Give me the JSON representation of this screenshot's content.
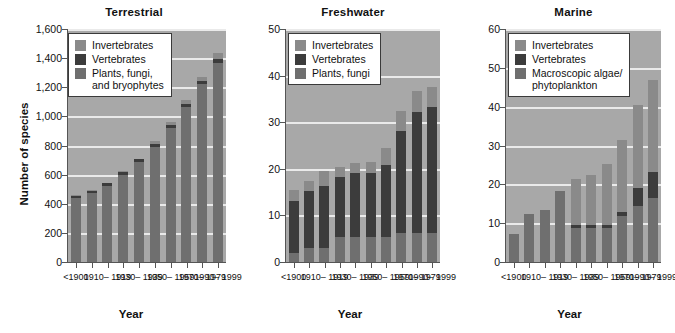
{
  "figure": {
    "axis_title_y": "Number of species",
    "axis_title_x": "Year"
  },
  "categories": [
    "<1900",
    "1900–1909",
    "1910–1919",
    "1920–1929",
    "1930–1939",
    "1940–1949",
    "1950–1959",
    "1960–1969",
    "1970–1979",
    "1980–1989"
  ],
  "tick_labels": [
    "<1900",
    "",
    "1910–\n1919",
    "",
    "1930–\n1939",
    "",
    "1950–\n1959",
    "",
    "1970–\n1979",
    "1990–\n1999"
  ],
  "colors": {
    "invertebrates": "#8a8a8a",
    "vertebrates": "#3c3c3c",
    "plants": "#6f6f6f",
    "plot_background": "#a8a8a8",
    "gridline": "#eaeaea",
    "axis": "#555555"
  },
  "panels": [
    {
      "id": "terrestrial",
      "title": "Terrestrial",
      "legend": [
        {
          "label": "Invertebrates",
          "color": "#8a8a8a"
        },
        {
          "label": "Vertebrates",
          "color": "#3c3c3c"
        },
        {
          "label": "Plants, fungi,\nand bryophytes",
          "color": "#6f6f6f"
        }
      ],
      "ylim": [
        0,
        1600
      ],
      "yticks": [
        0,
        200,
        400,
        600,
        800,
        1000,
        1200,
        1400,
        1600
      ],
      "ytick_labels": [
        "0",
        "200",
        "400",
        "600",
        "800",
        "1,000",
        "1,200",
        "1,400",
        "1,600"
      ]
    },
    {
      "id": "freshwater",
      "title": "Freshwater",
      "legend": [
        {
          "label": "Invertebrates",
          "color": "#8a8a8a"
        },
        {
          "label": "Vertebrates",
          "color": "#3c3c3c"
        },
        {
          "label": "Plants, fungi",
          "color": "#6f6f6f"
        }
      ],
      "ylim": [
        0,
        50
      ],
      "yticks": [
        0,
        10,
        20,
        30,
        40,
        50
      ],
      "ytick_labels": [
        "0",
        "10",
        "20",
        "30",
        "40",
        "50"
      ]
    },
    {
      "id": "marine",
      "title": "Marine",
      "legend": [
        {
          "label": "Invertebrates",
          "color": "#8a8a8a"
        },
        {
          "label": "Vertebrates",
          "color": "#3c3c3c"
        },
        {
          "label": "Macroscopic algae/\nphytoplankton",
          "color": "#6f6f6f"
        }
      ],
      "ylim": [
        0,
        60
      ],
      "yticks": [
        0,
        10,
        20,
        30,
        40,
        50,
        60
      ],
      "ytick_labels": [
        "0",
        "10",
        "20",
        "30",
        "40",
        "50",
        "60"
      ]
    }
  ],
  "chart_data": [
    {
      "type": "bar",
      "title": "Terrestrial",
      "stacked": true,
      "xlabel": "Year",
      "ylabel": "Number of species",
      "ylim": [
        0,
        1600
      ],
      "yticks": [
        0,
        200,
        400,
        600,
        800,
        1000,
        1200,
        1400,
        1600
      ],
      "grid": true,
      "legend_position": "top-left",
      "categories": [
        "<1900",
        "1900–1909",
        "1910–1919",
        "1920–1929",
        "1930–1939",
        "1940–1949",
        "1950–1959",
        "1960–1969",
        "1970–1979",
        "1990–1999"
      ],
      "series": [
        {
          "name": "Plants, fungi, and bryophytes",
          "color": "#6f6f6f",
          "values": [
            440,
            475,
            520,
            600,
            685,
            790,
            920,
            1065,
            1220,
            1370
          ]
        },
        {
          "name": "Vertebrates",
          "color": "#3c3c3c",
          "values": [
            15,
            15,
            20,
            20,
            20,
            20,
            20,
            20,
            20,
            25
          ]
        },
        {
          "name": "Invertebrates",
          "color": "#8a8a8a",
          "values": [
            5,
            5,
            5,
            5,
            5,
            20,
            20,
            30,
            30,
            40
          ]
        }
      ],
      "totals": [
        460,
        495,
        545,
        625,
        710,
        830,
        960,
        1115,
        1270,
        1435
      ]
    },
    {
      "type": "bar",
      "title": "Freshwater",
      "stacked": true,
      "xlabel": "Year",
      "ylabel": "Number of species",
      "ylim": [
        0,
        50
      ],
      "yticks": [
        0,
        10,
        20,
        30,
        40,
        50
      ],
      "grid": true,
      "legend_position": "top-left",
      "categories": [
        "<1900",
        "1900–1909",
        "1910–1919",
        "1920–1929",
        "1930–1939",
        "1940–1949",
        "1950–1959",
        "1960–1969",
        "1970–1979",
        "1990–1999"
      ],
      "series": [
        {
          "name": "Plants, fungi",
          "color": "#6f6f6f",
          "values": [
            2,
            3,
            3,
            5.3,
            5.3,
            5.3,
            5.3,
            6.2,
            6.2,
            6.2
          ]
        },
        {
          "name": "Vertebrates",
          "color": "#3c3c3c",
          "values": [
            11.2,
            12.2,
            13.4,
            13,
            13.8,
            13.8,
            15.5,
            22,
            26,
            27
          ]
        },
        {
          "name": "Invertebrates",
          "color": "#8a8a8a",
          "values": [
            2.3,
            2.2,
            3.2,
            2,
            2.2,
            2.4,
            3.7,
            4.3,
            4.4,
            4.3
          ]
        }
      ],
      "totals": [
        15.5,
        17.4,
        19.6,
        20.3,
        21.3,
        21.5,
        24.5,
        32.5,
        36.6,
        37.5
      ]
    },
    {
      "type": "bar",
      "title": "Marine",
      "stacked": true,
      "xlabel": "Year",
      "ylabel": "Number of species",
      "ylim": [
        0,
        60
      ],
      "yticks": [
        0,
        10,
        20,
        30,
        40,
        50,
        60
      ],
      "grid": true,
      "legend_position": "top-left",
      "categories": [
        "<1900",
        "1900–1909",
        "1910–1919",
        "1920–1929",
        "1930–1939",
        "1940–1949",
        "1950–1959",
        "1960–1969",
        "1970–1979",
        "1990–1999"
      ],
      "series": [
        {
          "name": "Macroscopic algae/phytoplankton",
          "color": "#6f6f6f",
          "values": [
            7.3,
            12.3,
            13.4,
            18.4,
            8.8,
            8.8,
            8.8,
            11.8,
            14.3,
            16.5,
            18.4
          ]
        },
        {
          "name": "Vertebrates",
          "color": "#3c3c3c",
          "values": [
            0,
            0,
            0,
            0,
            0.7,
            0.7,
            0.7,
            1.2,
            4.7,
            6.8,
            7
          ]
        },
        {
          "name": "Invertebrates",
          "color": "#8a8a8a",
          "values": [
            0,
            0,
            0,
            0,
            11.8,
            12.9,
            15.8,
            18.5,
            21.5,
            23.5,
            27.1
          ]
        }
      ],
      "totals": [
        7.3,
        12.3,
        13.4,
        18.4,
        21.3,
        22.4,
        25.3,
        31.5,
        40.5,
        46.8,
        52.5
      ]
    }
  ]
}
